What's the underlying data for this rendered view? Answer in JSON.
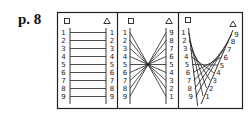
{
  "page_label": "p. 8",
  "panels": [
    {
      "name": "parallel",
      "left_symbol": "square",
      "right_symbol": "triangle",
      "left_labels": [
        "1",
        "2",
        "3",
        "4",
        "5",
        "6",
        "7",
        "8",
        "9"
      ],
      "right_labels": [
        "1",
        "2",
        "3",
        "4",
        "5",
        "6",
        "7",
        "8",
        "9"
      ],
      "connections": "left i to right i (same order)"
    },
    {
      "name": "reversed",
      "left_symbol": "square",
      "right_symbol": "triangle",
      "left_labels": [
        "1",
        "2",
        "3",
        "4",
        "5",
        "6",
        "7",
        "8",
        "9"
      ],
      "right_labels": [
        "9",
        "8",
        "7",
        "6",
        "5",
        "4",
        "3",
        "2",
        "1"
      ],
      "connections": "left i to right i (reversed order, crossing at center)"
    },
    {
      "name": "curved-envelope",
      "left_symbol": "square",
      "right_symbol": "triangle",
      "left_labels": [
        "1",
        "2",
        "3",
        "4",
        "5",
        "6",
        "7",
        "8",
        "9"
      ],
      "right_labels": [
        "9",
        "8",
        "7",
        "6",
        "5",
        "4",
        "3",
        "2",
        "1"
      ],
      "connections": "left i to right i on slanted axis, forming parabolic envelope"
    }
  ],
  "colors": {
    "line": "#222222",
    "border": "#222222",
    "background": "#ffffff"
  }
}
